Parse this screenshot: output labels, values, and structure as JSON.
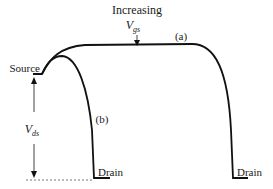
{
  "diagram": {
    "title_line1": "Increasing",
    "vgs_symbol": "V",
    "vgs_subscript": "gs",
    "curve_a_label": "(a)",
    "curve_b_label": "(b)",
    "source_label": "Source",
    "drain_label_b": "Drain",
    "drain_label_a": "Drain",
    "vds_symbol": "V",
    "vds_subscript": "ds",
    "colors": {
      "stroke": "#111111",
      "background": "#ffffff",
      "dashed": "#555555"
    }
  }
}
